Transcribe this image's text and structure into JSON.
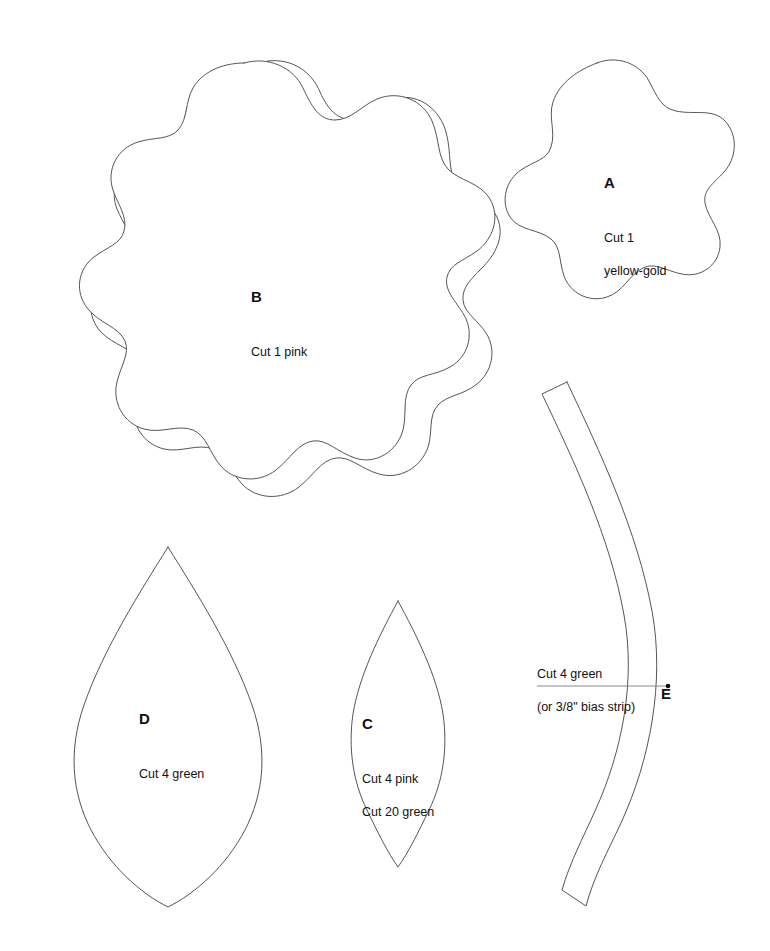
{
  "document": {
    "type": "applique-pattern-template-sheet",
    "background_color": "#ffffff",
    "line_color": "#555555",
    "text_color": "#111111",
    "width": 770,
    "height": 951
  },
  "pieces": [
    {
      "id": "a",
      "letter": "A",
      "shape": "five-lobed-scalloped-flower",
      "instructions": [
        "Cut 1",
        "yellow-gold"
      ]
    },
    {
      "id": "b",
      "letter": "B",
      "shape": "large-scalloped-flower",
      "instructions": [
        "Cut 1 pink"
      ]
    },
    {
      "id": "c",
      "letter": "C",
      "shape": "narrow-pointed-leaf",
      "instructions": [
        "Cut 4 pink",
        "Cut 20 green"
      ]
    },
    {
      "id": "d",
      "letter": "D",
      "shape": "wide-pointed-leaf",
      "instructions": [
        "Cut 4 green"
      ]
    },
    {
      "id": "e",
      "letter": "E",
      "shape": "curved-bias-strip",
      "instructions": [
        "Cut 4 green",
        "(or 3/8\" bias strip)"
      ]
    }
  ]
}
